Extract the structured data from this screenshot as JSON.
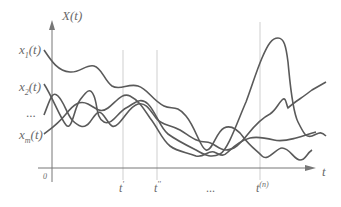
{
  "diagram": {
    "y_axis_label": "X(t)",
    "x_axis_label": "t",
    "origin_label": "0",
    "series_labels": [
      {
        "base": "x",
        "sub": "1",
        "suffix": "(t)"
      },
      {
        "base": "x",
        "sub": "2",
        "suffix": "(t)"
      },
      {
        "ellipsis": "..."
      },
      {
        "base": "x",
        "sub": "m",
        "suffix": "(t)"
      }
    ],
    "time_ticks": [
      {
        "label": "t",
        "sup": "'"
      },
      {
        "label": "t",
        "sup": "''"
      },
      {
        "label": "...",
        "sup": ""
      },
      {
        "label": "t",
        "sup": "(n)"
      }
    ],
    "colors": {
      "curve": "#5a5a5a",
      "axis": "#6a6a6a",
      "guide": "#c8c8c8",
      "label": "#6a6a6a"
    }
  }
}
